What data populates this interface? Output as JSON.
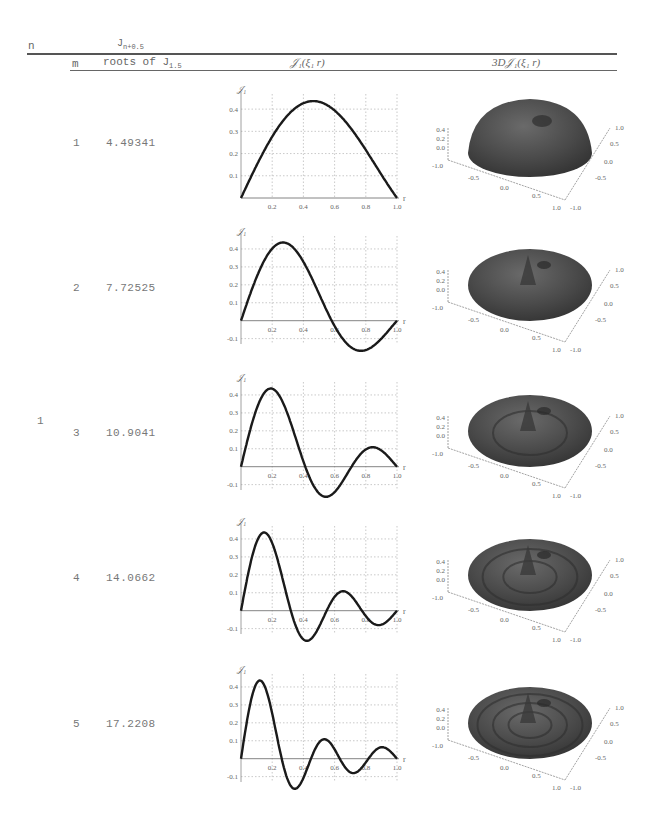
{
  "header": {
    "n_label": "n",
    "group_label": "J",
    "group_label_sub": "n+0.5",
    "m_label": "m",
    "roots_label": "roots of J",
    "roots_label_sub": "1.5",
    "plot2d_label": "𝒥₁(ξ₁ r)",
    "plot3d_label": "3D𝒥₁(ξ₁ r)"
  },
  "n_value": "1",
  "rows": [
    {
      "m": "1",
      "root": "4.49341"
    },
    {
      "m": "2",
      "root": "7.72525"
    },
    {
      "m": "3",
      "root": "10.9041"
    },
    {
      "m": "4",
      "root": "14.0662"
    },
    {
      "m": "5",
      "root": "17.2208"
    }
  ],
  "plot_labels": {
    "y_axis": "𝒥₁",
    "x_axis": "r",
    "x_ticks": [
      "0.2",
      "0.4",
      "0.6",
      "0.8",
      "1.0"
    ],
    "y_ticks_row1": [
      "0.1",
      "0.2",
      "0.3",
      "0.4"
    ],
    "y_ticks": [
      "-0.1",
      "0.1",
      "0.2",
      "0.3",
      "0.4"
    ],
    "z3d_ticks": [
      "0.4",
      "0.2",
      "0.0"
    ],
    "x3d_ticks": [
      "-1.0",
      "-0.5",
      "0.0",
      "0.5",
      "1.0"
    ],
    "y3d_ticks": [
      "1.0",
      "0.5",
      "0.0",
      "-0.5",
      "-1.0"
    ]
  },
  "chart_data": [
    {
      "type": "line",
      "title": "𝒥₁(ξ₁ r), m=1",
      "xlabel": "r",
      "ylabel": "𝒥₁",
      "xlim": [
        0,
        1
      ],
      "ylim": [
        0,
        0.45
      ],
      "grid": true,
      "xi": 4.49341,
      "x": [
        0,
        0.1,
        0.2,
        0.3,
        0.4,
        0.5,
        0.6,
        0.7,
        0.8,
        0.9,
        1.0
      ],
      "values": [
        0,
        0.146,
        0.278,
        0.377,
        0.43,
        0.432,
        0.386,
        0.302,
        0.196,
        0.089,
        0
      ]
    },
    {
      "type": "line",
      "title": "𝒥₁(ξ₂ r), m=2",
      "xlabel": "r",
      "ylabel": "𝒥₁",
      "xlim": [
        0,
        1
      ],
      "ylim": [
        -0.13,
        0.45
      ],
      "grid": true,
      "xi": 7.72525,
      "x": [
        0,
        0.1,
        0.2,
        0.3,
        0.4,
        0.5,
        0.6,
        0.7,
        0.8,
        0.9,
        1.0
      ],
      "values": [
        0,
        0.244,
        0.411,
        0.425,
        0.278,
        0.066,
        -0.092,
        -0.126,
        -0.118,
        -0.062,
        0
      ]
    },
    {
      "type": "line",
      "title": "𝒥₁(ξ₃ r), m=3",
      "xlabel": "r",
      "ylabel": "𝒥₁",
      "xlim": [
        0,
        1
      ],
      "ylim": [
        -0.13,
        0.45
      ],
      "grid": true,
      "xi": 10.9041,
      "x": [
        0,
        0.1,
        0.2,
        0.3,
        0.4,
        0.5,
        0.6,
        0.7,
        0.8,
        0.9,
        1.0
      ],
      "values": [
        0,
        0.331,
        0.434,
        0.201,
        -0.06,
        -0.131,
        -0.062,
        0.039,
        0.089,
        0.063,
        0
      ]
    },
    {
      "type": "line",
      "title": "𝒥₁(ξ₄ r), m=4",
      "xlabel": "r",
      "ylabel": "𝒥₁",
      "xlim": [
        0,
        1
      ],
      "ylim": [
        -0.13,
        0.45
      ],
      "grid": true,
      "xi": 14.0662,
      "x": [
        0,
        0.1,
        0.2,
        0.3,
        0.4,
        0.5,
        0.6,
        0.7,
        0.8,
        0.9,
        1.0
      ],
      "values": [
        0,
        0.4,
        0.29,
        -0.082,
        -0.119,
        0.019,
        0.098,
        0.036,
        -0.057,
        -0.052,
        0
      ]
    },
    {
      "type": "line",
      "title": "𝒥₁(ξ₅ r), m=5",
      "xlabel": "r",
      "ylabel": "𝒥₁",
      "xlim": [
        0,
        1
      ],
      "ylim": [
        -0.13,
        0.45
      ],
      "grid": true,
      "xi": 17.2208,
      "x": [
        0,
        0.1,
        0.2,
        0.3,
        0.4,
        0.5,
        0.6,
        0.7,
        0.8,
        0.9,
        1.0
      ],
      "values": [
        0,
        0.434,
        0.069,
        -0.125,
        0.048,
        0.073,
        -0.051,
        -0.034,
        0.055,
        0.012,
        0
      ]
    }
  ]
}
